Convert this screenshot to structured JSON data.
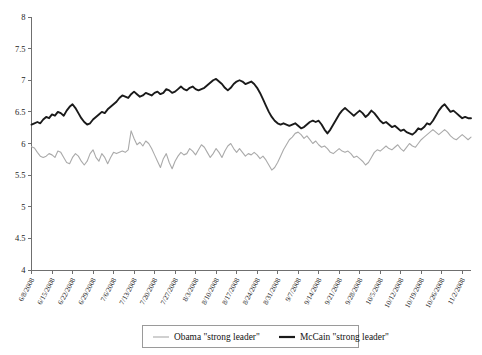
{
  "chart_data": {
    "type": "line",
    "title": "",
    "subtitle": "",
    "xlabel": "",
    "ylabel": "",
    "ylim": [
      4,
      8
    ],
    "ytick_values": [
      4,
      4.5,
      5,
      5.5,
      6,
      6.5,
      7,
      7.5,
      8
    ],
    "ytick_labels": [
      "4",
      "4.5",
      "5",
      "5.5",
      "6",
      "6.5",
      "7",
      "7.5",
      "8"
    ],
    "grid": false,
    "legend_position": "bottom-center",
    "x_tick_labels": [
      "6/8/2008",
      "6/15/2008",
      "6/22/2008",
      "6/29/2008",
      "7/6/2008",
      "7/13/2008",
      "7/20/2008",
      "7/27/2008",
      "8/3/2008",
      "8/10/2008",
      "8/17/2008",
      "8/24/2008",
      "8/31/2008",
      "9/7/2008",
      "9/14/2008",
      "9/21/2008",
      "9/28/2008",
      "10/5/2008",
      "10/12/2008",
      "10/19/2008",
      "10/26/2008",
      "11/2/2008"
    ],
    "x_tick_index": [
      0,
      7,
      14,
      21,
      28,
      35,
      42,
      49,
      56,
      63,
      70,
      77,
      84,
      91,
      98,
      105,
      112,
      119,
      126,
      133,
      140,
      147
    ],
    "x_range_index": [
      0,
      150
    ],
    "series": [
      {
        "name": "Obama \"strong leader\"",
        "color": "#aaaaaa",
        "width": 1.1,
        "values": [
          5.95,
          5.93,
          5.86,
          5.8,
          5.78,
          5.8,
          5.84,
          5.82,
          5.78,
          5.88,
          5.86,
          5.78,
          5.7,
          5.68,
          5.78,
          5.84,
          5.8,
          5.72,
          5.66,
          5.72,
          5.84,
          5.9,
          5.78,
          5.72,
          5.84,
          5.78,
          5.68,
          5.78,
          5.86,
          5.84,
          5.86,
          5.88,
          5.86,
          5.9,
          6.2,
          6.08,
          5.98,
          6.02,
          5.96,
          6.04,
          6.0,
          5.92,
          5.82,
          5.72,
          5.62,
          5.76,
          5.84,
          5.7,
          5.6,
          5.72,
          5.8,
          5.86,
          5.82,
          5.84,
          5.92,
          5.88,
          5.82,
          5.9,
          5.98,
          5.94,
          5.86,
          5.78,
          5.84,
          5.92,
          5.86,
          5.78,
          5.88,
          5.96,
          6.0,
          5.92,
          5.86,
          5.92,
          5.86,
          5.8,
          5.84,
          5.82,
          5.86,
          5.82,
          5.76,
          5.8,
          5.74,
          5.66,
          5.58,
          5.62,
          5.7,
          5.8,
          5.9,
          5.98,
          6.06,
          6.1,
          6.16,
          6.18,
          6.14,
          6.08,
          6.12,
          6.06,
          6.0,
          6.04,
          5.98,
          5.94,
          5.96,
          5.92,
          5.86,
          5.84,
          5.88,
          5.92,
          5.88,
          5.86,
          5.88,
          5.84,
          5.78,
          5.8,
          5.76,
          5.72,
          5.66,
          5.7,
          5.78,
          5.86,
          5.9,
          5.88,
          5.92,
          5.96,
          5.92,
          5.9,
          5.94,
          5.98,
          5.92,
          5.88,
          5.94,
          6.0,
          5.96,
          5.94,
          6.0,
          6.06,
          6.1,
          6.14,
          6.18,
          6.22,
          6.18,
          6.14,
          6.18,
          6.22,
          6.18,
          6.12,
          6.08,
          6.06,
          6.1,
          6.14,
          6.1,
          6.06,
          6.1
        ]
      },
      {
        "name": "McCain \"strong leader\"",
        "color": "#1a1a1a",
        "width": 1.9,
        "values": [
          6.3,
          6.32,
          6.34,
          6.32,
          6.38,
          6.42,
          6.4,
          6.46,
          6.44,
          6.5,
          6.48,
          6.44,
          6.52,
          6.58,
          6.62,
          6.56,
          6.48,
          6.4,
          6.34,
          6.3,
          6.32,
          6.38,
          6.42,
          6.46,
          6.5,
          6.48,
          6.54,
          6.58,
          6.62,
          6.66,
          6.72,
          6.76,
          6.74,
          6.72,
          6.78,
          6.82,
          6.78,
          6.74,
          6.76,
          6.8,
          6.78,
          6.76,
          6.8,
          6.82,
          6.78,
          6.8,
          6.86,
          6.84,
          6.8,
          6.82,
          6.86,
          6.9,
          6.86,
          6.84,
          6.88,
          6.9,
          6.86,
          6.84,
          6.86,
          6.88,
          6.92,
          6.96,
          7.0,
          7.02,
          6.98,
          6.94,
          6.88,
          6.84,
          6.88,
          6.94,
          6.98,
          7.0,
          6.98,
          6.94,
          6.96,
          6.98,
          6.94,
          6.88,
          6.8,
          6.7,
          6.6,
          6.5,
          6.42,
          6.36,
          6.32,
          6.3,
          6.32,
          6.3,
          6.28,
          6.3,
          6.32,
          6.28,
          6.24,
          6.26,
          6.3,
          6.34,
          6.36,
          6.34,
          6.36,
          6.3,
          6.22,
          6.16,
          6.22,
          6.3,
          6.38,
          6.46,
          6.52,
          6.56,
          6.52,
          6.48,
          6.44,
          6.48,
          6.52,
          6.48,
          6.42,
          6.46,
          6.52,
          6.48,
          6.42,
          6.36,
          6.32,
          6.34,
          6.3,
          6.26,
          6.28,
          6.24,
          6.2,
          6.22,
          6.18,
          6.16,
          6.14,
          6.18,
          6.24,
          6.22,
          6.26,
          6.32,
          6.3,
          6.36,
          6.44,
          6.52,
          6.58,
          6.62,
          6.56,
          6.5,
          6.52,
          6.48,
          6.44,
          6.4,
          6.42,
          6.4,
          6.4
        ]
      }
    ]
  },
  "legend": {
    "items": [
      {
        "label": "Obama \"strong leader\"",
        "color": "#aaaaaa",
        "width": 1.1
      },
      {
        "label": "McCain \"strong leader\"",
        "color": "#1a1a1a",
        "width": 2.2
      }
    ]
  }
}
